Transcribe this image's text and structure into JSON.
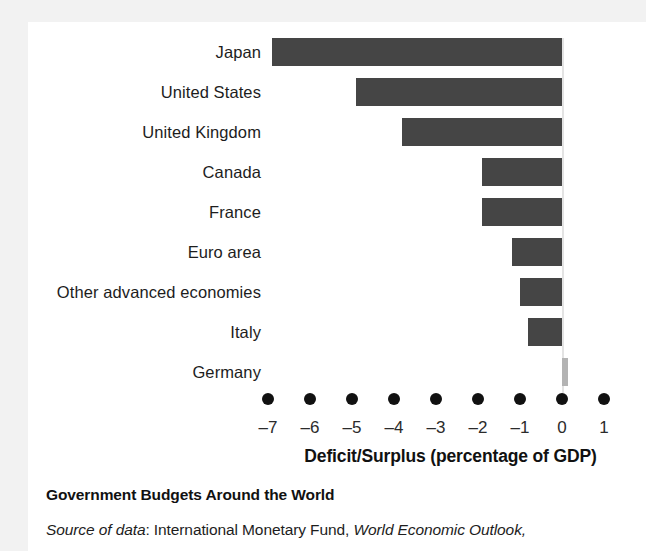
{
  "figure": {
    "caption_title": "Government Budgets Around the World",
    "source_prefix": "Source of data",
    "source_sep": ": ",
    "source_org": "International Monetary Fund, ",
    "source_publication": "World Economic Outlook,"
  },
  "colors": {
    "bar_negative": "#454545",
    "bar_positive": "#b3b3b3",
    "zero_line": "#e3e3e3",
    "dot": "#111111",
    "paper": "#ffffff",
    "page_margin": "#f2f2f2",
    "text": "#1d1d1d"
  },
  "chart_data": {
    "type": "bar",
    "orientation": "horizontal",
    "title": "Government Budgets Around the World",
    "xlabel": "Deficit/Surplus (percentage of GDP)",
    "ylabel": "",
    "xlim": [
      -7.3,
      1.3
    ],
    "xticks": [
      -7,
      -6,
      -5,
      -4,
      -3,
      -2,
      -1,
      0,
      1
    ],
    "xticklabels": [
      "–7",
      "–6",
      "–5",
      "–4",
      "–3",
      "–2",
      "–1",
      "0",
      "1"
    ],
    "grid": false,
    "legend": false,
    "tick_marker_style": "dot",
    "categories": [
      "Japan",
      "United States",
      "United Kingdom",
      "Canada",
      "France",
      "Euro area",
      "Other advanced economies",
      "Italy",
      "Germany"
    ],
    "values": [
      -6.9,
      -4.9,
      -3.8,
      -1.9,
      -1.9,
      -1.2,
      -1.0,
      -0.8,
      0.15
    ],
    "bar_colors": [
      "#454545",
      "#454545",
      "#454545",
      "#454545",
      "#454545",
      "#454545",
      "#454545",
      "#454545",
      "#b3b3b3"
    ]
  }
}
